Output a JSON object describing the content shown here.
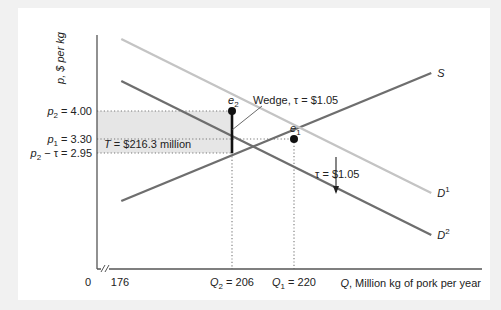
{
  "chart_data": {
    "type": "line",
    "title": "",
    "xlabel": "Q, Million kg of pork per year",
    "ylabel": "p, $ per kg",
    "xlim": [
      176,
      263
    ],
    "ylim": [
      1.0,
      5.2
    ],
    "axis_break_x": true,
    "x_ticks": [
      {
        "value": 0,
        "label": "0"
      },
      {
        "value": 176,
        "label": "176"
      },
      {
        "value": 206,
        "label_var": "Q",
        "label_sub": "2",
        "label_rest": " = 206"
      },
      {
        "value": 220,
        "label_var": "Q",
        "label_sub": "1",
        "label_rest": " = 220"
      }
    ],
    "y_ticks": [
      {
        "value": 4.0,
        "label_var": "p",
        "label_sub": "2",
        "label_rest": " = 4.00"
      },
      {
        "value": 3.3,
        "label_var": "p",
        "label_sub": "1",
        "label_rest": " = 3.30"
      },
      {
        "value": 2.95,
        "label_var": "p",
        "label_sub": "2",
        "label_rest": " − τ = 2.95"
      }
    ],
    "series": [
      {
        "name": "S",
        "label": "S",
        "label_sup": "",
        "color": "#6e6e6e",
        "points": [
          [
            181,
            1.75
          ],
          [
            251,
            4.95
          ]
        ]
      },
      {
        "name": "D1",
        "label": "D",
        "label_sup": "1",
        "color": "#c4c4c4",
        "points": [
          [
            181,
            5.8
          ],
          [
            251,
            1.95
          ]
        ]
      },
      {
        "name": "D2",
        "label": "D",
        "label_sup": "2",
        "color": "#6e6e6e",
        "points": [
          [
            181,
            4.75
          ],
          [
            251,
            0.9
          ]
        ]
      }
    ],
    "equilibria": [
      {
        "name": "e1",
        "label": "e",
        "sub": "1",
        "q": 220,
        "p": 3.3
      },
      {
        "name": "e2",
        "label": "e",
        "sub": "2",
        "q": 206,
        "p": 4.0
      }
    ],
    "tax_revenue_area": {
      "label_var": "T",
      "label_rest": " = $216.3 million",
      "q": 206,
      "p_top": 4.0,
      "p_bottom": 2.95,
      "fill": "#e6e6e6"
    },
    "annotations": [
      {
        "name": "wedge",
        "text": "Wedge, τ = $1.05"
      },
      {
        "name": "tax-shift",
        "text": "τ = $1.05"
      }
    ]
  }
}
